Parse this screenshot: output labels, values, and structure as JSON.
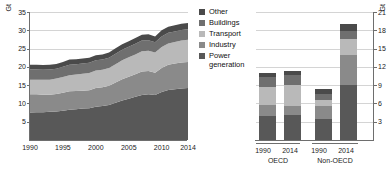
{
  "chart_data": [
    {
      "type": "area",
      "id": "global-stacked-area",
      "title": "",
      "xlabel": "",
      "ylabel": "Gt",
      "ylim": [
        0,
        35
      ],
      "yticks": [
        5,
        10,
        15,
        20,
        25,
        30,
        35
      ],
      "xticks": [
        1990,
        1995,
        2000,
        2005,
        2010,
        2014
      ],
      "xlim": [
        1990,
        2014
      ],
      "grid": true,
      "legend_position": "center",
      "x": [
        1990,
        1991,
        1992,
        1993,
        1994,
        1995,
        1996,
        1997,
        1998,
        1999,
        2000,
        2001,
        2002,
        2003,
        2004,
        2005,
        2006,
        2007,
        2008,
        2009,
        2010,
        2011,
        2012,
        2013,
        2014
      ],
      "series": [
        {
          "name": "Power generation",
          "color": "#585858",
          "values": [
            7.5,
            7.6,
            7.6,
            7.7,
            7.8,
            8.0,
            8.3,
            8.4,
            8.6,
            8.7,
            9.1,
            9.3,
            9.6,
            10.2,
            10.8,
            11.3,
            11.8,
            12.3,
            12.5,
            12.3,
            13.1,
            13.7,
            13.9,
            14.1,
            14.2
          ]
        },
        {
          "name": "Industry",
          "color": "#8a8a8a",
          "values": [
            5.0,
            4.9,
            4.8,
            4.7,
            4.8,
            4.9,
            5.0,
            5.0,
            4.9,
            4.9,
            5.1,
            5.1,
            5.2,
            5.5,
            5.8,
            6.0,
            6.2,
            6.4,
            6.4,
            6.1,
            6.6,
            6.9,
            7.0,
            7.1,
            7.1
          ]
        },
        {
          "name": "Transport",
          "color": "#b9b9b9",
          "values": [
            4.0,
            4.0,
            4.1,
            4.1,
            4.2,
            4.3,
            4.4,
            4.5,
            4.6,
            4.7,
            4.8,
            4.8,
            4.9,
            5.0,
            5.2,
            5.3,
            5.4,
            5.6,
            5.5,
            5.5,
            5.7,
            5.8,
            5.9,
            6.0,
            6.1
          ]
        },
        {
          "name": "Buildings",
          "color": "#6f6f6f",
          "values": [
            2.8,
            2.8,
            2.7,
            2.8,
            2.7,
            2.8,
            2.9,
            2.8,
            2.8,
            2.8,
            2.8,
            2.8,
            2.8,
            2.9,
            2.9,
            2.9,
            2.9,
            2.9,
            2.9,
            2.8,
            2.9,
            2.9,
            2.9,
            2.9,
            2.9
          ]
        },
        {
          "name": "Other",
          "color": "#4a4a4a",
          "values": [
            1.3,
            1.3,
            1.3,
            1.3,
            1.3,
            1.3,
            1.4,
            1.4,
            1.4,
            1.4,
            1.4,
            1.4,
            1.4,
            1.5,
            1.5,
            1.5,
            1.6,
            1.6,
            1.6,
            1.6,
            1.7,
            1.7,
            1.7,
            1.7,
            1.7
          ]
        }
      ],
      "totals": [
        20.6,
        20.6,
        20.5,
        20.6,
        20.8,
        21.3,
        22.0,
        22.1,
        22.3,
        22.5,
        23.2,
        23.4,
        23.9,
        25.1,
        26.2,
        27.0,
        27.9,
        28.8,
        28.9,
        28.3,
        30.0,
        31.0,
        31.4,
        31.8,
        32.0
      ]
    },
    {
      "type": "bar",
      "id": "oecd-nonoecd-stacked-bars",
      "title": "",
      "ylabel": "Gt",
      "ylim": [
        0,
        21
      ],
      "yticks": [
        3,
        6,
        9,
        12,
        15,
        18,
        21
      ],
      "grid": true,
      "groups": [
        {
          "name": "OECD",
          "categories": [
            "1990",
            "2014"
          ]
        },
        {
          "name": "Non-OECD",
          "categories": [
            "1990",
            "2014"
          ]
        }
      ],
      "categories": [
        "1990",
        "2014",
        "1990",
        "2014"
      ],
      "series": [
        {
          "name": "Power generation",
          "color": "#585858",
          "values": [
            3.9,
            4.1,
            3.5,
            9.0
          ]
        },
        {
          "name": "Industry",
          "color": "#8a8a8a",
          "values": [
            1.9,
            1.5,
            2.0,
            5.0
          ]
        },
        {
          "name": "Transport",
          "color": "#b9b9b9",
          "values": [
            2.9,
            3.4,
            1.1,
            2.5
          ]
        },
        {
          "name": "Buildings",
          "color": "#6f6f6f",
          "values": [
            1.7,
            1.6,
            1.0,
            1.4
          ]
        },
        {
          "name": "Other",
          "color": "#4a4a4a",
          "values": [
            0.6,
            0.7,
            0.7,
            1.2
          ]
        }
      ],
      "totals": [
        11.0,
        11.3,
        8.3,
        19.1
      ]
    }
  ],
  "left_axis": {
    "unit": "Gt",
    "ticks": [
      "35",
      "30",
      "25",
      "20",
      "15",
      "10",
      "5"
    ]
  },
  "right_axis": {
    "unit": "Gt",
    "ticks": [
      "21",
      "18",
      "15",
      "12",
      "9",
      "6",
      "3"
    ]
  },
  "area_x_labels": [
    "1990",
    "1995",
    "2000",
    "2005",
    "2010",
    "2014"
  ],
  "legend": {
    "items": [
      {
        "label": "Other",
        "color": "#4a4a4a"
      },
      {
        "label": "Buildings",
        "color": "#6f6f6f"
      },
      {
        "label": "Transport",
        "color": "#b9b9b9"
      },
      {
        "label": "Industry",
        "color": "#8a8a8a"
      },
      {
        "label": "Power\ngeneration",
        "color": "#585858"
      }
    ]
  },
  "bar_labels": {
    "oecd_1990": "1990",
    "oecd_2014": "2014",
    "oecd_group": "OECD",
    "nonoecd_1990": "1990",
    "nonoecd_2014": "2014",
    "nonoecd_group": "Non-OECD"
  }
}
